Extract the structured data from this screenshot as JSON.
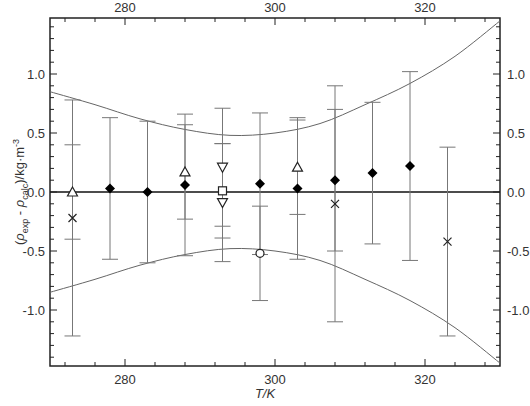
{
  "chart_data": {
    "type": "scatter",
    "title": "",
    "xlabel": "T/K",
    "ylabel": "(ρexp - ρcalc)/kg·m-3",
    "ylabel_parts": {
      "open": "(",
      "rho1": "ρ",
      "sub1": "exp",
      "minus": " - ",
      "rho2": "ρ",
      "sub2": "calc",
      "close": ")/kg·m",
      "sup": "-3"
    },
    "xlim": [
      270,
      330
    ],
    "ylim": [
      -1.47,
      1.47
    ],
    "x_ticks": [
      280,
      300,
      320
    ],
    "x_tick_labels": [
      "280",
      "300",
      "320"
    ],
    "y_ticks": [
      -1.0,
      -0.5,
      0.0,
      0.5,
      1.0
    ],
    "y_tick_labels": [
      "-1.0",
      "-0.5",
      "0.0",
      "0.5",
      "1.0"
    ],
    "grid": false,
    "legend": null,
    "zero_line": true,
    "series": [
      {
        "name": "filled-diamond",
        "marker": "diamond-filled",
        "points": [
          {
            "x": 278,
            "y": 0.03,
            "err": 0.6
          },
          {
            "x": 283,
            "y": 0.0,
            "err": 0.6
          },
          {
            "x": 288,
            "y": 0.06,
            "err": 0.6
          },
          {
            "x": 298,
            "y": 0.07,
            "err": 0.6
          },
          {
            "x": 303,
            "y": 0.03,
            "err": 0.6
          },
          {
            "x": 308,
            "y": 0.1,
            "err": 0.6
          },
          {
            "x": 313,
            "y": 0.16,
            "err": 0.6
          },
          {
            "x": 318,
            "y": 0.22,
            "err": 0.8
          }
        ]
      },
      {
        "name": "open-triangle-up",
        "marker": "triangle-up-open",
        "points": [
          {
            "x": 273,
            "y": 0.0,
            "err": 0.4
          },
          {
            "x": 288,
            "y": 0.17,
            "err": 0.4
          },
          {
            "x": 303,
            "y": 0.21,
            "err": 0.4
          }
        ]
      },
      {
        "name": "open-triangle-down",
        "marker": "triangle-down-open",
        "points": [
          {
            "x": 293,
            "y": 0.21,
            "err": 0.5
          },
          {
            "x": 293,
            "y": -0.09,
            "err": 0.5
          }
        ]
      },
      {
        "name": "open-square",
        "marker": "square-open",
        "points": [
          {
            "x": 293,
            "y": 0.01,
            "err": 0.4
          }
        ]
      },
      {
        "name": "open-circle",
        "marker": "circle-open",
        "points": [
          {
            "x": 298,
            "y": -0.52,
            "err": 0.4
          }
        ]
      },
      {
        "name": "cross",
        "marker": "x",
        "points": [
          {
            "x": 273,
            "y": -0.22,
            "err": 1.0
          },
          {
            "x": 308,
            "y": -0.1,
            "err": 1.0
          },
          {
            "x": 323,
            "y": -0.42,
            "err": 0.8
          }
        ]
      }
    ],
    "envelope": {
      "description": "uncertainty band (upper and mirrored lower curve)",
      "x": [
        270,
        276,
        282,
        288,
        294,
        300,
        306,
        312,
        318,
        324,
        330
      ],
      "upper": [
        0.85,
        0.74,
        0.62,
        0.53,
        0.48,
        0.5,
        0.58,
        0.74,
        0.92,
        1.15,
        1.45
      ],
      "lower": [
        -0.85,
        -0.74,
        -0.62,
        -0.53,
        -0.48,
        -0.5,
        -0.58,
        -0.74,
        -0.92,
        -1.15,
        -1.45
      ]
    }
  }
}
